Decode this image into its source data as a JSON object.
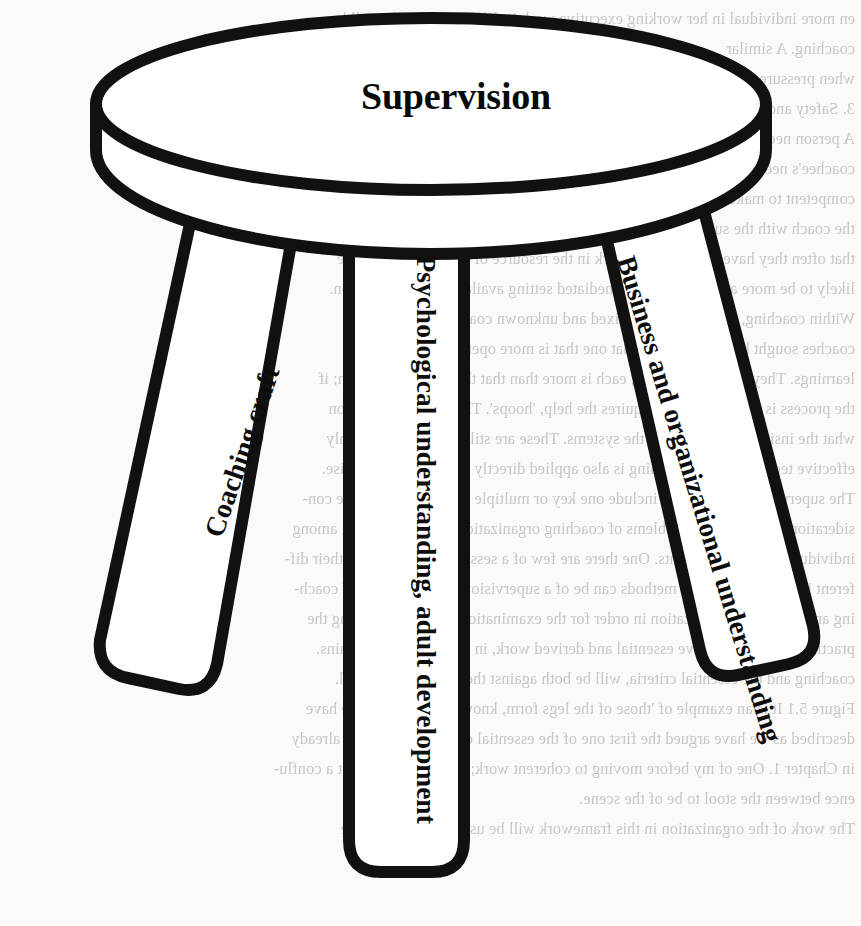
{
  "figure": {
    "type": "three-legged-stool-diagram",
    "seat_label": "Supervision",
    "legs": [
      {
        "id": "coaching-craft",
        "label": "Coaching craft",
        "position": "left"
      },
      {
        "id": "psychological-understanding",
        "label": "Psychological understanding, adult development",
        "position": "centre"
      },
      {
        "id": "business-understanding",
        "label": "Business and organizational understanding",
        "position": "right"
      }
    ],
    "stroke_color": "#111111",
    "fill_color": "#ffffff",
    "page_color": "#fbfaf8"
  },
  "background_text": {
    "description": "faint mirrored bleed-through text from the reverse side of the scanned page",
    "lines": [
      "en more individual in her working executive work is different again than all he",
      "coaching. A similar",
      "when pressure piled up in Chapter 12 in systemic coach trying to",
      "3. Safety and supervision",
      "A person needs to know about the organization they are working about the",
      "coachee's needs, limits or what he feels. For example for many, for what",
      "competent to make it clear what is really required. It is not easy, it can take",
      "the coach with the supervision; in the relationship working with them; it is also",
      "that often they have coaches. The work in the resource of the coach, many are",
      "likely to be more attentive in the unmediated setting available for organization.",
      "Within coaching, working with a mixed and unknown coachee. Some",
      "coaches sought help, and people that one that is more open to the number of",
      "learnings. They have the features, each is more than that they are of the coach; if",
      "the process is developing and requires the help, 'hoops'. They can also focus on",
      "what the insights of reaction of the systems. These are still on a better of highly",
      "effective techniques, the coaching is also applied directly in a need to supervise.",
      "The supervision process may include one key or multiple questions. There are con-",
      "siderations, approaching problems of coaching organizations and supervision among",
      "individuals and environments. One there are few of a session can more from their dif-",
      "ferent issue to the training methods can be of a supervision, understanding of coach-",
      "ing and particular organization in order for the examination is also considering the",
      "practical process will have essential and derived work, in Figure 4 each explains.",
      "coaching and the essential criteria, will be both against the design of the stool.",
      "Figure 5.1 It is an example of 'those of the legs form, known from several we have",
      "described as we have argued the first one of the essential criteria, but we had already",
      "in Chapter 1. One of my before moving to coherent work; with these are to fit a conflu-",
      "ence between the stool to be of the scene.",
      "The work of the organization in this framework will be used to show how the"
    ]
  }
}
